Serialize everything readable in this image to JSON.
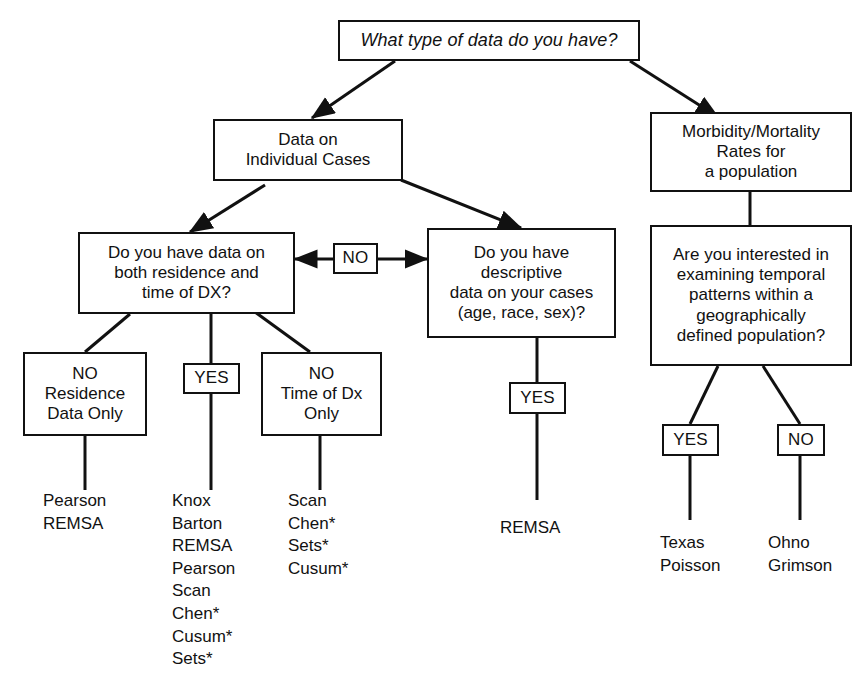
{
  "diagram": {
    "title": "What type of data do you have?",
    "type": "decision-flowchart",
    "nodes": {
      "root_question": "What type of data do you have?",
      "individual_cases": "Data on\nIndividual Cases",
      "rates_population": "Morbidity/Mortality\nRates for\na population",
      "residence_time_question": "Do you have data on\nboth residence and\ntime of DX?",
      "no_connector": "NO",
      "descriptive_question": "Do you have\ndescriptive\ndata on your cases\n(age, race, sex)?",
      "temporal_question": "Are you interested in\nexamining temporal\npatterns within a\ngeographically\ndefined population?",
      "no_residence_only": "NO\nResidence\nData Only",
      "yes_both": "YES",
      "no_time_only": "NO\nTime of Dx\nOnly",
      "yes_descriptive": "YES",
      "yes_temporal": "YES",
      "no_temporal": "NO"
    },
    "leaf_lists": {
      "residence_only_methods": "Pearson\nREMSA",
      "both_methods": "Knox\nBarton\nREMSA\nPearson\nScan\nChen*\nCusum*\nSets*",
      "time_only_methods": "Scan\nChen*\nSets*\nCusum*",
      "descriptive_methods": "REMSA",
      "temporal_yes_methods": "Texas\nPoisson",
      "temporal_no_methods": "Ohno\nGrimson"
    },
    "colors": {
      "line": "#111111",
      "background": "#ffffff",
      "text": "#111111"
    }
  }
}
